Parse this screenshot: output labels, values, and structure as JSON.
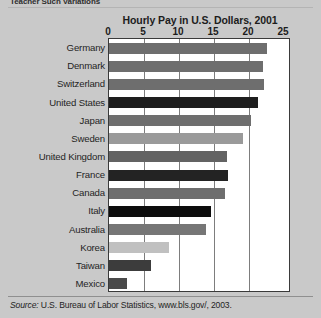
{
  "figure": {
    "clipped_caption": "Teacher Such Variations",
    "source_note_prefix": "Source:",
    "source_note": "U.S. Bureau of Labor Statistics, www.bls.gov/, 2003."
  },
  "chart_data": {
    "type": "bar",
    "orientation": "horizontal",
    "title": "Hourly Pay in U.S. Dollars, 2001",
    "xlabel": "",
    "ylabel": "",
    "xlim": [
      0,
      25
    ],
    "xticks": [
      0,
      5,
      10,
      15,
      20,
      25
    ],
    "xtick_labels": [
      "0",
      "5",
      "10",
      "15",
      "20",
      "25"
    ],
    "grid": true,
    "grid_axis": "x",
    "legend": false,
    "categories": [
      "Germany",
      "Denmark",
      "Switzerland",
      "United States",
      "Japan",
      "Sweden",
      "United Kingdom",
      "France",
      "Canada",
      "Italy",
      "Australia",
      "Korea",
      "Taiwan",
      "Mexico"
    ],
    "values": [
      22.5,
      22.0,
      22.1,
      21.3,
      20.3,
      19.1,
      16.9,
      17.0,
      16.6,
      14.6,
      13.9,
      8.6,
      6.0,
      2.6
    ],
    "bar_colors": [
      "#6e6e6e",
      "#6e6e6e",
      "#6e6e6e",
      "#1e1e1e",
      "#6e6e6e",
      "#9a9a9a",
      "#636363",
      "#232323",
      "#6e6e6e",
      "#0d0d0d",
      "#767676",
      "#c0c0c0",
      "#3c3c3c",
      "#4a4a4a"
    ]
  }
}
